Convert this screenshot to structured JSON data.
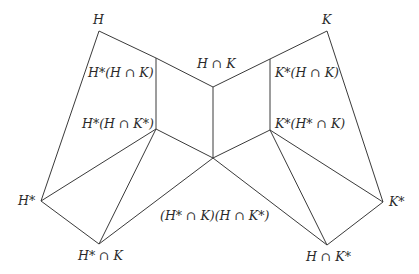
{
  "nodes": {
    "H": {
      "label": "H",
      "x": 99,
      "y": 31
    },
    "K": {
      "label": "K",
      "x": 327,
      "y": 31
    },
    "HstarHK": {
      "label": "H*(H ∩ K)",
      "x": 156,
      "y": 58
    },
    "KstarHK": {
      "label": "K*(H ∩ K)",
      "x": 270,
      "y": 59
    },
    "HK": {
      "label": "H ∩ K",
      "x": 213,
      "y": 87
    },
    "HstarHKstar": {
      "label": "H*(H ∩ K*)",
      "x": 156,
      "y": 129
    },
    "KstarHstarK": {
      "label": "K*(H* ∩ K)",
      "x": 270,
      "y": 130
    },
    "center": {
      "label": "(H* ∩ K)(H ∩ K*)",
      "x": 213,
      "y": 158
    },
    "Hstar": {
      "label": "H*",
      "x": 41,
      "y": 201
    },
    "Kstar": {
      "label": "K*",
      "x": 383,
      "y": 202
    },
    "HstarK": {
      "label": "H* ∩ K",
      "x": 99,
      "y": 244
    },
    "HKstar": {
      "label": "H ∩ K*",
      "x": 327,
      "y": 245
    }
  },
  "edges": [
    [
      "H",
      "HstarHK"
    ],
    [
      "HstarHK",
      "HK"
    ],
    [
      "HK",
      "KstarHK"
    ],
    [
      "KstarHK",
      "K"
    ],
    [
      "H",
      "Hstar"
    ],
    [
      "K",
      "Kstar"
    ],
    [
      "HstarHK",
      "HstarHKstar"
    ],
    [
      "HK",
      "center"
    ],
    [
      "KstarHK",
      "KstarHstarK"
    ],
    [
      "HstarHKstar",
      "center"
    ],
    [
      "center",
      "KstarHstarK"
    ],
    [
      "Hstar",
      "HstarHKstar"
    ],
    [
      "HstarK",
      "HstarHKstar"
    ],
    [
      "Hstar",
      "HstarK"
    ],
    [
      "HstarK",
      "center"
    ],
    [
      "Kstar",
      "KstarHstarK"
    ],
    [
      "HKstar",
      "KstarHstarK"
    ],
    [
      "Kstar",
      "HKstar"
    ],
    [
      "HKstar",
      "center"
    ]
  ],
  "labels": {
    "H": "H",
    "K": "K",
    "HK": "H ∩ K",
    "HstarHK": "H*(H ∩ K)",
    "KstarHK": "K*(H ∩ K)",
    "HstarHKstar": "H*(H ∩ K*)",
    "KstarHstarK": "K*(H* ∩ K)",
    "Hstar": "H*",
    "Kstar": "K*",
    "center": "(H* ∩ K)(H ∩ K*)",
    "HstarK": "H* ∩ K",
    "HKstar": "H ∩ K*"
  },
  "style": {
    "line_color": "#3a3a3a",
    "text_color": "#2a2a2a"
  }
}
